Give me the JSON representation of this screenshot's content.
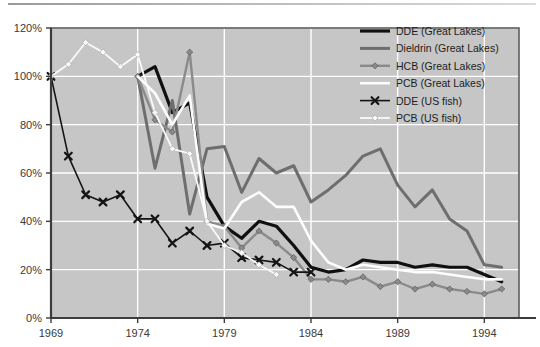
{
  "figure": {
    "background_color": "#ffffff",
    "plot_background_color": "#c6c6c6",
    "grid_color": "#ffffff",
    "axis_color": "#3c3c3c",
    "top_rule": true
  },
  "chart_data": {
    "type": "line",
    "title": "",
    "subtitle": "",
    "xlabel": "",
    "ylabel": "",
    "xlim": [
      1969,
      1996
    ],
    "ylim": [
      0,
      120
    ],
    "yunit": "%",
    "grid": true,
    "legend_position": "top-right",
    "x_ticks": [
      1969,
      1974,
      1979,
      1984,
      1989,
      1994
    ],
    "x_tick_labels": [
      "1969",
      "1974",
      "1979",
      "1984",
      "1989",
      "1994"
    ],
    "y_ticks": [
      0,
      20,
      40,
      60,
      80,
      100,
      120
    ],
    "y_tick_labels": [
      "0%",
      "20%",
      "40%",
      "60%",
      "80%",
      "100%",
      "120%"
    ],
    "series": [
      {
        "name": "DDE (Great Lakes)",
        "color": "#101010",
        "width": 3.2,
        "marker": "none",
        "x": [
          1974,
          1975,
          1976,
          1977,
          1978,
          1979,
          1980,
          1981,
          1982,
          1983,
          1984,
          1985,
          1986,
          1987,
          1988,
          1989,
          1990,
          1991,
          1992,
          1993,
          1994,
          1995
        ],
        "values": [
          100,
          104,
          85,
          89,
          50,
          38,
          33,
          40,
          38,
          30,
          21,
          19,
          20,
          24,
          23,
          23,
          21,
          22,
          21,
          21,
          18,
          15
        ]
      },
      {
        "name": "Dieldrin (Great Lakes)",
        "color": "#6e6e6e",
        "width": 3.0,
        "marker": "none",
        "x": [
          1974,
          1975,
          1976,
          1977,
          1978,
          1979,
          1980,
          1981,
          1982,
          1983,
          1984,
          1985,
          1986,
          1987,
          1988,
          1989,
          1990,
          1991,
          1992,
          1993,
          1994,
          1995
        ],
        "values": [
          100,
          62,
          90,
          43,
          70,
          71,
          52,
          66,
          60,
          63,
          48,
          53,
          59,
          67,
          70,
          55,
          46,
          53,
          41,
          36,
          22,
          21
        ]
      },
      {
        "name": "HCB (Great Lakes)",
        "color": "#8a8a8a",
        "width": 2.4,
        "marker": "diamond",
        "x": [
          1974,
          1975,
          1976,
          1977,
          1978,
          1979,
          1980,
          1981,
          1982,
          1983,
          1984,
          1985,
          1986,
          1987,
          1988,
          1989,
          1990,
          1991,
          1992,
          1993,
          1994,
          1995
        ],
        "values": [
          100,
          82,
          77,
          110,
          40,
          38,
          29,
          36,
          31,
          25,
          16,
          16,
          15,
          17,
          13,
          15,
          12,
          14,
          12,
          11,
          10,
          12
        ]
      },
      {
        "name": "PCB (Great Lakes)",
        "color": "#fdfdfd",
        "width": 2.6,
        "marker": "none",
        "x": [
          1974,
          1975,
          1976,
          1977,
          1978,
          1979,
          1980,
          1981,
          1982,
          1983,
          1984,
          1985,
          1986,
          1987,
          1988,
          1989,
          1990,
          1991,
          1992,
          1993,
          1994,
          1995
        ],
        "values": [
          100,
          93,
          80,
          92,
          39,
          37,
          48,
          52,
          46,
          46,
          32,
          23,
          20,
          22,
          21,
          20,
          19,
          19,
          18,
          17,
          16,
          16
        ]
      },
      {
        "name": "DDE (US fish)",
        "color": "#151515",
        "width": 1.6,
        "marker": "x",
        "x": [
          1969,
          1970,
          1971,
          1972,
          1973,
          1974,
          1975,
          1976,
          1977,
          1978,
          1979,
          1980,
          1981,
          1982,
          1983,
          1984
        ],
        "values": [
          100,
          67,
          51,
          48,
          51,
          41,
          41,
          31,
          36,
          30,
          31,
          25,
          24,
          23,
          19,
          19
        ]
      },
      {
        "name": "PCB (US fish)",
        "color": "#fafafa",
        "width": 1.8,
        "marker": "diamond",
        "x": [
          1969,
          1970,
          1971,
          1972,
          1973,
          1974,
          1975,
          1976,
          1977,
          1978,
          1979,
          1980,
          1981,
          1982
        ],
        "values": [
          100,
          105,
          114,
          110,
          104,
          109,
          85,
          70,
          68,
          40,
          30,
          27,
          22,
          18
        ]
      }
    ],
    "legend_entries": [
      {
        "label": "DDE (Great Lakes)",
        "color": "#101010",
        "marker": "none",
        "width": 3.2
      },
      {
        "label": "Dieldrin (Great Lakes)",
        "color": "#6e6e6e",
        "marker": "none",
        "width": 3.0
      },
      {
        "label": "HCB (Great Lakes)",
        "color": "#8a8a8a",
        "marker": "diamond",
        "width": 2.4
      },
      {
        "label": "PCB (Great Lakes)",
        "color": "#fdfdfd",
        "marker": "none",
        "width": 2.6
      },
      {
        "label": "DDE (US fish)",
        "color": "#151515",
        "marker": "x",
        "width": 1.6
      },
      {
        "label": "PCB (US fish)",
        "color": "#fafafa",
        "marker": "diamond",
        "width": 1.8
      }
    ]
  }
}
